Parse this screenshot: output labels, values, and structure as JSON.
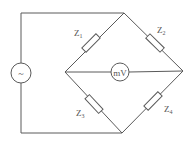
{
  "diagram": {
    "type": "bridge-circuit",
    "source": {
      "symbol": "~",
      "name": "ac-source"
    },
    "meter": {
      "label": "mV"
    },
    "impedances": [
      {
        "id": "Z1",
        "base": "Z",
        "sub": "1"
      },
      {
        "id": "Z2",
        "base": "Z",
        "sub": "2"
      },
      {
        "id": "Z3",
        "base": "Z",
        "sub": "3"
      },
      {
        "id": "Z4",
        "base": "Z",
        "sub": "4"
      }
    ],
    "colors": {
      "line": "#5a5a5a",
      "text": "#555555",
      "background": "#ffffff"
    }
  }
}
